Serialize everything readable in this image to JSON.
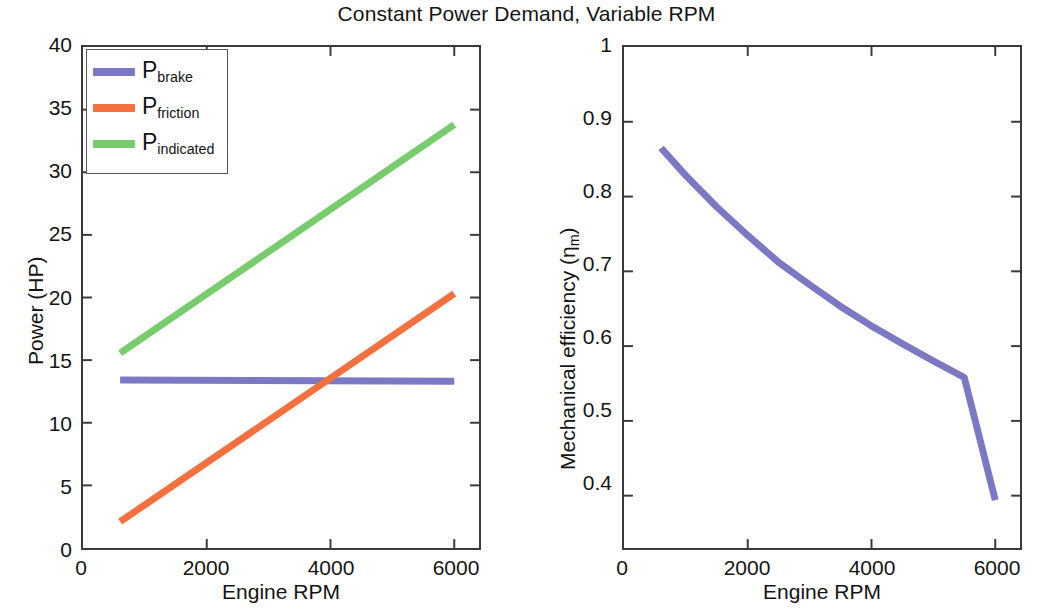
{
  "figure": {
    "title": "Constant Power Demand, Variable RPM",
    "width": 1053,
    "height": 612
  },
  "colors": {
    "brake": "#7b79c4",
    "friction": "#f4703e",
    "indicated": "#78cc6d",
    "axis": "#3a3a3a",
    "text": "#141414"
  },
  "left_panel": {
    "xlabel": "Engine RPM",
    "ylabel": "Power (HP)",
    "xticks": [
      "0",
      "2000",
      "4000",
      "6000"
    ],
    "yticks": [
      "0",
      "5",
      "10",
      "15",
      "20",
      "25",
      "30",
      "35",
      "40"
    ],
    "legend": [
      {
        "symbol": "P",
        "subscript": "brake",
        "color_key": "brake"
      },
      {
        "symbol": "P",
        "subscript": "friction",
        "color_key": "friction"
      },
      {
        "symbol": "P",
        "subscript": "indicated",
        "color_key": "indicated"
      }
    ]
  },
  "right_panel": {
    "xlabel": "Engine RPM",
    "ylabel_prefix": "Mechanical efficiency (",
    "ylabel_eta": "η",
    "ylabel_sub": "m",
    "ylabel_suffix": ")",
    "xticks": [
      "0",
      "2000",
      "4000",
      "6000"
    ],
    "yticks": [
      "0.4",
      "0.5",
      "0.6",
      "0.7",
      "0.8",
      "0.9",
      "1"
    ]
  },
  "chart_data": [
    {
      "type": "line",
      "panel": "left",
      "title": "Constant Power Demand, Variable RPM",
      "xlabel": "Engine RPM",
      "ylabel": "Power (HP)",
      "xlim": [
        0,
        6400
      ],
      "ylim": [
        0,
        40
      ],
      "xticks": [
        0,
        2000,
        4000,
        6000
      ],
      "yticks": [
        0,
        5,
        10,
        15,
        20,
        25,
        30,
        35,
        40
      ],
      "grid": false,
      "legend_position": "upper left",
      "x": [
        600,
        1000,
        1500,
        2000,
        2500,
        3000,
        3500,
        4000,
        4500,
        5000,
        5500,
        6000
      ],
      "series": [
        {
          "name": "P_brake",
          "color": "#7b79c4",
          "values": [
            13.42,
            13.41,
            13.4,
            13.39,
            13.38,
            13.37,
            13.36,
            13.35,
            13.34,
            13.33,
            13.32,
            13.31
          ]
        },
        {
          "name": "P_friction",
          "color": "#f4703e",
          "values": [
            2.1,
            2.78,
            3.63,
            4.48,
            5.33,
            6.18,
            7.03,
            7.88,
            8.73,
            9.58,
            10.43,
            20.3
          ]
        },
        {
          "name": "P_indicated",
          "color": "#78cc6d",
          "values": [
            15.55,
            16.2,
            17.05,
            17.9,
            18.75,
            19.6,
            20.45,
            21.3,
            22.15,
            23.0,
            23.85,
            33.8
          ]
        }
      ],
      "series_note": {
        "P_friction": "linear from 2.10 HP at 600 RPM to 20.30 HP at 6000 RPM",
        "P_indicated": "linear from 15.55 HP at 600 RPM to 33.80 HP at 6000 RPM",
        "P_brake": "near-constant ~13.4 HP across the RPM range"
      }
    },
    {
      "type": "line",
      "panel": "right",
      "xlabel": "Engine RPM",
      "ylabel": "Mechanical efficiency (ηm)",
      "xlim": [
        0,
        6400
      ],
      "ylim": [
        0.33,
        1.0
      ],
      "xticks": [
        0,
        2000,
        4000,
        6000
      ],
      "yticks": [
        0.4,
        0.5,
        0.6,
        0.7,
        0.8,
        0.9,
        1.0
      ],
      "grid": false,
      "x": [
        600,
        1000,
        1500,
        2000,
        2500,
        3000,
        3500,
        4000,
        4500,
        5000,
        5500,
        6000
      ],
      "series": [
        {
          "name": "Mechanical efficiency",
          "color": "#7b79c4",
          "values": [
            0.865,
            0.828,
            0.786,
            0.748,
            0.712,
            0.682,
            0.653,
            0.627,
            0.603,
            0.58,
            0.558,
            0.394
          ]
        }
      ],
      "series_note": "Monotonically decreasing convex curve from 0.865 at 600 RPM to 0.394 at 6000 RPM"
    }
  ]
}
